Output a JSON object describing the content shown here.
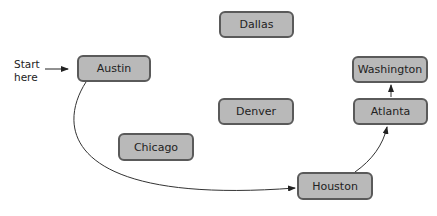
{
  "diagram": {
    "start_label": "Start here",
    "start_label_lines": [
      "Start",
      "here"
    ],
    "node_fill": "#b9b9b9",
    "node_border": "#5a5a5a",
    "nodes": [
      {
        "id": "austin",
        "label": "Austin",
        "x": 77,
        "y": 55,
        "w": 74,
        "h": 27
      },
      {
        "id": "dallas",
        "label": "Dallas",
        "x": 219,
        "y": 11,
        "w": 75,
        "h": 27
      },
      {
        "id": "washington",
        "label": "Washington",
        "x": 352,
        "y": 56,
        "w": 76,
        "h": 27
      },
      {
        "id": "atlanta",
        "label": "Atlanta",
        "x": 353,
        "y": 98,
        "w": 75,
        "h": 27
      },
      {
        "id": "denver",
        "label": "Denver",
        "x": 218,
        "y": 98,
        "w": 76,
        "h": 27
      },
      {
        "id": "chicago",
        "label": "Chicago",
        "x": 118,
        "y": 133,
        "w": 76,
        "h": 28
      },
      {
        "id": "houston",
        "label": "Houston",
        "x": 297,
        "y": 172,
        "w": 76,
        "h": 28
      }
    ],
    "edges": [
      {
        "from": "start",
        "to": "austin"
      },
      {
        "from": "austin",
        "to": "houston"
      },
      {
        "from": "houston",
        "to": "atlanta"
      },
      {
        "from": "atlanta",
        "to": "washington"
      }
    ]
  }
}
